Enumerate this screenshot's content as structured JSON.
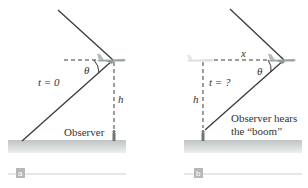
{
  "panels": [
    {
      "id": "a",
      "tag": "a",
      "time_label": "t = 0",
      "angle_label": "θ",
      "height_label": "h",
      "observer_label": "Observer"
    },
    {
      "id": "b",
      "tag": "b",
      "time_label": "t = ?",
      "angle_label": "θ",
      "height_label": "h",
      "distance_label": "x",
      "observer_label_line1": "Observer hears",
      "observer_label_line2": "the “boom”"
    }
  ],
  "colors": {
    "line": "#3a3a3a",
    "ground": "#c9cccc",
    "tag_bg": "#b7b7b7",
    "rule": "#cfcfcf"
  }
}
